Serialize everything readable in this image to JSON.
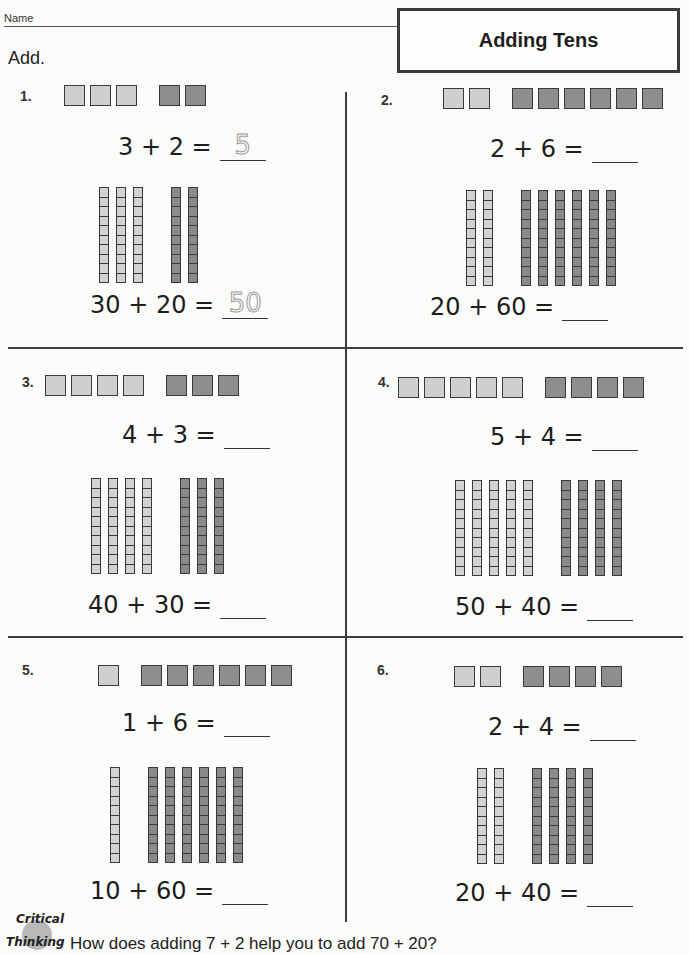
{
  "header": {
    "name_label": "Name",
    "title": "Adding Tens",
    "instruction": "Add."
  },
  "problems": [
    {
      "label": "1.",
      "ones_a": 3,
      "ones_b": 2,
      "equation_ones": "3 + 2 =",
      "answer_ones": "5",
      "equation_tens": "30 + 20 =",
      "answer_tens": "50"
    },
    {
      "label": "2.",
      "ones_a": 2,
      "ones_b": 6,
      "equation_ones": "2 + 6 =",
      "answer_ones": "",
      "equation_tens": "20 + 60 =",
      "answer_tens": ""
    },
    {
      "label": "3.",
      "ones_a": 4,
      "ones_b": 3,
      "equation_ones": "4 + 3 =",
      "answer_ones": "",
      "equation_tens": "40 + 30 =",
      "answer_tens": ""
    },
    {
      "label": "4.",
      "ones_a": 5,
      "ones_b": 4,
      "equation_ones": "5 + 4 =",
      "answer_ones": "",
      "equation_tens": "50 + 40 =",
      "answer_tens": ""
    },
    {
      "label": "5.",
      "ones_a": 1,
      "ones_b": 6,
      "equation_ones": "1 + 6 =",
      "answer_ones": "",
      "equation_tens": "10 + 60 =",
      "answer_tens": ""
    },
    {
      "label": "6.",
      "ones_a": 2,
      "ones_b": 4,
      "equation_ones": "2 + 4 =",
      "answer_ones": "",
      "equation_tens": "20 + 40 =",
      "answer_tens": ""
    }
  ],
  "critical_thinking": {
    "badge_line1": "Critical",
    "badge_line2": "Thinking",
    "question": "How does adding 7 + 2 help you to add 70 + 20?"
  },
  "colors": {
    "light_block": "#cfcfcf",
    "dark_block": "#8e8e8e",
    "outline": "#3a3a3a"
  }
}
